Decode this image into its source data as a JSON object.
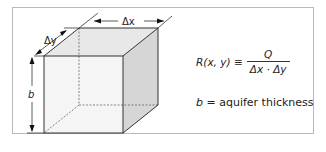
{
  "diagram": {
    "labels": {
      "dx": "Δx",
      "dy": "Δy",
      "b": "b"
    },
    "equation": {
      "lhs": "R(x, y) ≡",
      "numerator": "Q",
      "denominator": "Δx · Δy"
    },
    "definition": {
      "symbol": "b",
      "text": " = aquifer thickness"
    },
    "colors": {
      "frame": "#b9b9b9",
      "edge": "#333333",
      "front_face": "#f4f4f4",
      "top_face": "#e6e6e6",
      "side_face": "#d9d9d9"
    }
  }
}
